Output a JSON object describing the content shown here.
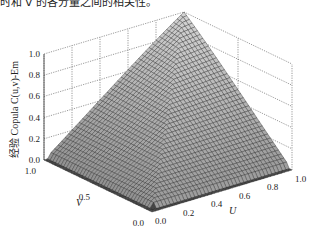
{
  "caption_fragment": "时和 v 的各分量之间的相关性。",
  "chart_data": {
    "type": "surface3d",
    "title": "",
    "xlabel": "U",
    "ylabel": "V",
    "zlabel": "经验 Copula C(u,v)-Em",
    "x_ticks": [
      "0.0",
      "0.2",
      "0.4",
      "0.6",
      "0.8",
      "1.0"
    ],
    "y_ticks": [
      "0.0",
      "0.5",
      "1.0"
    ],
    "z_ticks": [
      "0.0",
      "0.2",
      "0.4",
      "0.6",
      "0.8",
      "1.0"
    ],
    "xlim": [
      0,
      1
    ],
    "ylim": [
      0,
      1
    ],
    "zlim": [
      0,
      1
    ],
    "grid": true,
    "surface": "empirical copula C(u,v) ≈ min(u,v)-like comonotonic surface, rising from 0 at the u=0 / v=0 edges (sharp step near the edges) to 1 at (1,1)",
    "sample_points": [
      {
        "u": 0.0,
        "v": 0.0,
        "c": 0.0
      },
      {
        "u": 1.0,
        "v": 0.0,
        "c": 0.0
      },
      {
        "u": 0.0,
        "v": 1.0,
        "c": 0.0
      },
      {
        "u": 0.5,
        "v": 0.5,
        "c": 0.45
      },
      {
        "u": 1.0,
        "v": 0.5,
        "c": 0.5
      },
      {
        "u": 0.5,
        "v": 1.0,
        "c": 0.5
      },
      {
        "u": 1.0,
        "v": 1.0,
        "c": 1.0
      }
    ],
    "colormap": "gray"
  },
  "labels": {
    "z_axis": "经验 Copula C(u,v)-Em",
    "u_axis": "U",
    "v_axis": "V"
  }
}
